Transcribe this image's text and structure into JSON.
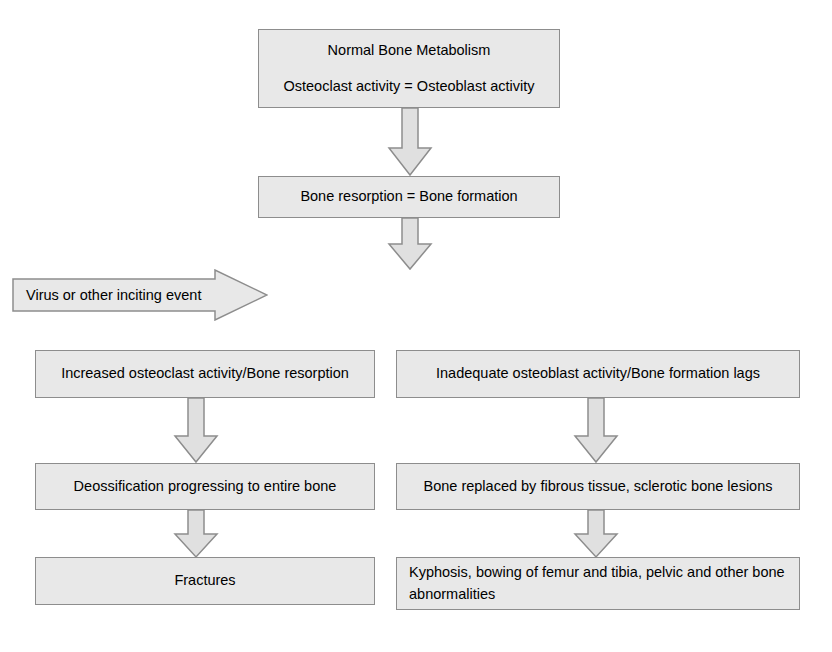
{
  "diagram": {
    "colors": {
      "node_fill": "#e8e8e8",
      "node_border": "#8d8d8d",
      "arrow_fill": "#e0e0e0",
      "arrow_border": "#8d8d8d",
      "text": "#000000",
      "background": "#ffffff"
    },
    "nodes": [
      {
        "id": "normal-bone-metabolism",
        "lines": [
          "Normal Bone Metabolism",
          "Osteoclast activity = Osteoblast activity"
        ]
      },
      {
        "id": "bone-resorption-equals-formation",
        "lines": [
          "Bone resorption = Bone formation"
        ]
      },
      {
        "id": "increased-osteoclast-activity",
        "lines": [
          "Increased osteoclast activity/Bone resorption"
        ]
      },
      {
        "id": "inadequate-osteoblast-activity",
        "lines": [
          "Inadequate osteoblast activity/Bone formation lags"
        ]
      },
      {
        "id": "deossification",
        "lines": [
          "Deossification progressing to entire bone"
        ]
      },
      {
        "id": "bone-replaced-fibrous-tissue",
        "lines": [
          "Bone replaced by fibrous tissue, sclerotic bone lesions"
        ]
      },
      {
        "id": "fractures",
        "lines": [
          "Fractures"
        ]
      },
      {
        "id": "kyphosis-bone-abnormalities",
        "lines": [
          "Kyphosis, bowing of femur and tibia, pelvic and other bone abnormalities"
        ]
      }
    ],
    "connectors": [
      {
        "id": "arrow-metabolism-to-resorption",
        "direction": "down"
      },
      {
        "id": "arrow-resorption-to-split",
        "direction": "down"
      },
      {
        "id": "arrow-inciting-event",
        "direction": "right",
        "label": "Virus or other inciting event"
      },
      {
        "id": "arrow-osteoclast-to-deossification",
        "direction": "down"
      },
      {
        "id": "arrow-deossification-to-fractures",
        "direction": "down"
      },
      {
        "id": "arrow-osteoblast-to-fibrous",
        "direction": "down"
      },
      {
        "id": "arrow-fibrous-to-kyphosis",
        "direction": "down"
      }
    ]
  }
}
